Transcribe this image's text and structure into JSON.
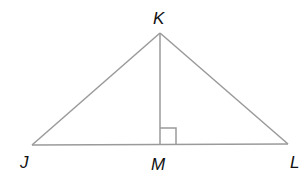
{
  "diagram": {
    "colors": {
      "line": "#9a9a9a",
      "label": "#111111"
    },
    "points": {
      "K": {
        "label": "K",
        "x": 160,
        "y": 33
      },
      "J": {
        "label": "J",
        "x": 32,
        "y": 145
      },
      "L": {
        "label": "L",
        "x": 288,
        "y": 144
      },
      "M": {
        "label": "M",
        "x": 160,
        "y": 144
      }
    },
    "segments": [
      "JK",
      "KL",
      "JL",
      "KM"
    ],
    "right_angle_at": "M"
  }
}
